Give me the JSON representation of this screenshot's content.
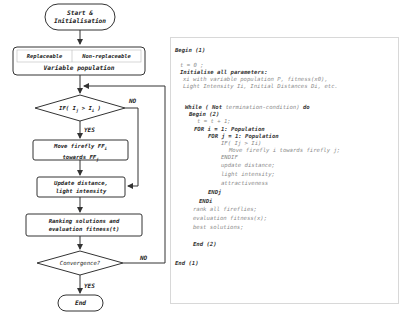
{
  "flowchart": {
    "start": "Start &\nInitialisation",
    "start_line1": "Start &",
    "start_line2": "Initialisation",
    "population": {
      "replaceable": "Replaceable",
      "non_replaceable": "Non-replaceable",
      "label": "Variable population"
    },
    "decision1": "IF( Ij > Ii )",
    "decision1_parts": {
      "prefix": "IF( I",
      "sub1": "j",
      "mid": " > I",
      "sub2": "i",
      "suffix": " )"
    },
    "decision1_no": "NO",
    "decision1_yes": "YES",
    "move": {
      "line1_prefix": "Move firefly FF",
      "line1_sub": "i",
      "line2_prefix": "towards FF",
      "line2_sub": "j"
    },
    "update": {
      "line1": "Update distance,",
      "line2": "light intensity"
    },
    "ranking": {
      "line1": "Ranking solutions and",
      "line2": "evaluation fitness(t)"
    },
    "decision2": "Convergence?",
    "decision2_no": "NO",
    "decision2_yes": "YES",
    "end": "End"
  },
  "pseudocode": {
    "lines": [
      {
        "text": "Begin (1)",
        "style": "kw",
        "indent": 0
      },
      {
        "text": "t = 0 ;",
        "style": "cm",
        "indent": 1
      },
      {
        "text": "Initialise all parameters:",
        "style": "kw",
        "indent": 1
      },
      {
        "text": "xi with variable population P, fitness(x0),",
        "style": "cm",
        "indent": 1.3
      },
      {
        "text": "Light Intensity Ii, Initial Distances Di, etc.",
        "style": "cm",
        "indent": 1.3
      },
      {
        "text": "While ( Not termination-condition) do",
        "style": "mixed",
        "indent": 2
      },
      {
        "text": "Begin (2)",
        "style": "kw",
        "indent": 2.5
      },
      {
        "text": "t  =  t + 1;",
        "style": "cm",
        "indent": 3
      },
      {
        "text": "FOR i = 1: Population",
        "style": "kw",
        "indent": 3
      },
      {
        "text": "FOR j = 1: Population",
        "style": "kw",
        "indent": 4
      },
      {
        "text": "IF( Ij > Ii)",
        "style": "cm",
        "indent": 5
      },
      {
        "text": "Move firefly i towards firefly j;",
        "style": "cm",
        "indent": 6
      },
      {
        "text": "ENDIF",
        "style": "cm",
        "indent": 5
      },
      {
        "text": "update distance;",
        "style": "cm",
        "indent": 5
      },
      {
        "text": "light intensity;",
        "style": "cm",
        "indent": 5
      },
      {
        "text": "attractiveness",
        "style": "cm",
        "indent": 5
      },
      {
        "text": "ENDj",
        "style": "kw",
        "indent": 4
      },
      {
        "text": "ENDi",
        "style": "kw",
        "indent": 3
      },
      {
        "text": "rank all fireflies;",
        "style": "cm",
        "indent": 2.5
      },
      {
        "text": "evaluation fitness(x);",
        "style": "cm",
        "indent": 2.5
      },
      {
        "text": "best solutions;",
        "style": "cm",
        "indent": 2.5
      },
      {
        "text": "End (2)",
        "style": "kw",
        "indent": 2.5
      },
      {
        "text": "End (1)",
        "style": "kw",
        "indent": 0
      }
    ],
    "while_parts": {
      "kw1": "While ( Not",
      "cm": " termination-condition)",
      "kw2": " do"
    }
  },
  "colors": {
    "line": "#333333",
    "keyword": "#333333",
    "comment": "#8a8a8a",
    "border": "#d8d8d8"
  }
}
